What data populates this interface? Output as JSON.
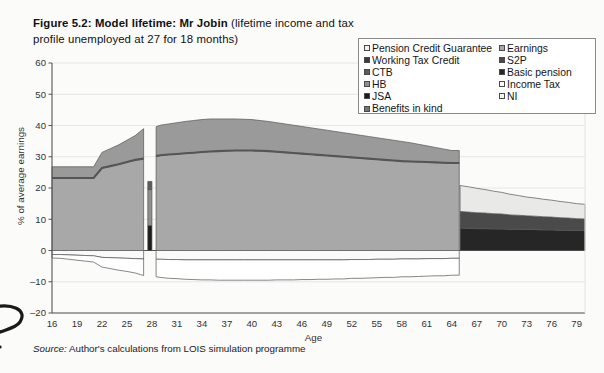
{
  "figure": {
    "title_strong": "Figure 5.2: Model lifetime: Mr Jobin",
    "title_rest": " (lifetime income and tax profile unemployed at 27 for 18 months)",
    "source_lead": "Source:",
    "source_text": " Author's calculations from LOIS simulation programme"
  },
  "legend": {
    "left_column": [
      {
        "label": "Pension Credit Guarantee",
        "swatch": "#f2f2f0"
      },
      {
        "label": "Working Tax Credit",
        "swatch": "#3b3b3b"
      },
      {
        "label": "CTB",
        "swatch": "#5d5d5d"
      },
      {
        "label": "HB",
        "swatch": "#8f8f8f"
      },
      {
        "label": "JSA",
        "swatch": "#1c1c1c"
      },
      {
        "label": "Benefits in kind",
        "swatch": "#767676"
      }
    ],
    "right_column": [
      {
        "label": "Earnings",
        "swatch": "#a8a8a8"
      },
      {
        "label": "S2P",
        "swatch": "#4a4a4a"
      },
      {
        "label": "Basic pension",
        "swatch": "#262626"
      },
      {
        "label": "Income Tax",
        "swatch": "#fbfbfa"
      },
      {
        "label": "NI",
        "swatch": "#f4f4f2"
      }
    ]
  },
  "chart_data": {
    "type": "area",
    "title": "Figure 5.2: Model lifetime: Mr Jobin (lifetime income and tax profile unemployed at 27 for 18 months)",
    "xlabel": "Age",
    "ylabel": "% of average earnings",
    "xlim": [
      16,
      80
    ],
    "ylim": [
      -20,
      60
    ],
    "ytick_values": [
      -20,
      -10,
      0,
      10,
      20,
      30,
      40,
      50,
      60
    ],
    "xtick_values": [
      16,
      19,
      22,
      25,
      28,
      31,
      34,
      37,
      40,
      43,
      46,
      49,
      52,
      55,
      58,
      61,
      64,
      67,
      70,
      73,
      76,
      79
    ],
    "grid": "horizontal",
    "legend_position": "top-right",
    "stacking": "stacked-positive-and-negative",
    "colors": {
      "earnings": "#a8a8a8",
      "benefits_in_kind": "#9a9a9a",
      "benefits_line": "#555555",
      "jsa": "#1c1c1c",
      "hb": "#8f8f8f",
      "ctb": "#5d5d5d",
      "working_tax_credit": "#3b3b3b",
      "basic_pension": "#262626",
      "s2p": "#4a4a4a",
      "pension_credit_guarantee": "#e9e9e7",
      "income_tax": "#ffffff",
      "ni": "#fafaf8",
      "outline": "#555555",
      "axis": "#555555",
      "gridline": "#e2e2e0"
    },
    "x": [
      16,
      17,
      18,
      19,
      20,
      21,
      22,
      23,
      24,
      25,
      26,
      27,
      27.5,
      28,
      28.5,
      29,
      30,
      31,
      32,
      33,
      34,
      35,
      36,
      37,
      38,
      39,
      40,
      41,
      42,
      43,
      44,
      45,
      46,
      47,
      48,
      49,
      50,
      51,
      52,
      53,
      54,
      55,
      56,
      57,
      58,
      59,
      60,
      61,
      62,
      63,
      64,
      64.9,
      65,
      66,
      67,
      68,
      69,
      70,
      71,
      72,
      73,
      74,
      75,
      76,
      77,
      78,
      79,
      80
    ],
    "series": [
      {
        "name": "Earnings",
        "key": "earnings",
        "color": "#a8a8a8",
        "values": [
          23.2,
          23.2,
          23.2,
          23.2,
          23.2,
          23.2,
          26.4,
          27.0,
          27.6,
          28.3,
          29.0,
          29.4,
          0,
          0,
          30.2,
          30.5,
          30.7,
          30.9,
          31.1,
          31.3,
          31.5,
          31.7,
          31.8,
          31.9,
          32.0,
          32.0,
          32.0,
          31.9,
          31.8,
          31.6,
          31.4,
          31.2,
          31.0,
          30.8,
          30.6,
          30.4,
          30.2,
          30.0,
          29.8,
          29.6,
          29.4,
          29.2,
          29.0,
          28.8,
          28.6,
          28.5,
          28.4,
          28.3,
          28.2,
          28.1,
          28.0,
          28.0,
          0,
          0,
          0,
          0,
          0,
          0,
          0,
          0,
          0,
          0,
          0,
          0,
          0,
          0,
          0,
          0
        ]
      },
      {
        "name": "Benefits in kind",
        "key": "benefits_in_kind",
        "color": "#9a9a9a",
        "values": [
          3.6,
          3.6,
          3.6,
          3.6,
          3.6,
          3.6,
          5.0,
          5.6,
          6.2,
          7.0,
          7.8,
          9.6,
          0,
          0,
          9.4,
          9.6,
          9.8,
          10.0,
          10.2,
          10.3,
          10.4,
          10.4,
          10.3,
          10.2,
          10.1,
          10.0,
          9.9,
          9.7,
          9.5,
          9.3,
          9.1,
          8.9,
          8.7,
          8.5,
          8.3,
          8.1,
          7.9,
          7.7,
          7.5,
          7.3,
          7.1,
          6.9,
          6.7,
          6.5,
          6.3,
          6.0,
          5.6,
          5.2,
          4.8,
          4.4,
          4.0,
          4.0,
          0,
          0,
          0,
          0,
          0,
          0,
          0,
          0,
          0,
          0,
          0,
          0,
          0,
          0,
          0,
          0
        ]
      },
      {
        "name": "JSA",
        "key": "jsa",
        "color": "#1c1c1c",
        "values": [
          0,
          0,
          0,
          0,
          0,
          0,
          0,
          0,
          0,
          0,
          0,
          0,
          8.0,
          8.0,
          0,
          0,
          0,
          0,
          0,
          0,
          0,
          0,
          0,
          0,
          0,
          0,
          0,
          0,
          0,
          0,
          0,
          0,
          0,
          0,
          0,
          0,
          0,
          0,
          0,
          0,
          0,
          0,
          0,
          0,
          0,
          0,
          0,
          0,
          0,
          0,
          0,
          0,
          0,
          0,
          0,
          0,
          0,
          0,
          0,
          0,
          0,
          0,
          0,
          0,
          0,
          0,
          0,
          0
        ]
      },
      {
        "name": "HB",
        "key": "hb",
        "color": "#8f8f8f",
        "values": [
          0,
          0,
          0,
          0,
          0,
          0,
          0,
          0,
          0,
          0,
          0,
          0,
          11.5,
          11.5,
          0,
          0,
          0,
          0,
          0,
          0,
          0,
          0,
          0,
          0,
          0,
          0,
          0,
          0,
          0,
          0,
          0,
          0,
          0,
          0,
          0,
          0,
          0,
          0,
          0,
          0,
          0,
          0,
          0,
          0,
          0,
          0,
          0,
          0,
          0,
          0,
          0,
          0,
          0,
          0,
          0,
          0,
          0,
          0,
          0,
          0,
          0,
          0,
          0,
          0,
          0,
          0,
          0,
          0
        ]
      },
      {
        "name": "CTB",
        "key": "ctb",
        "color": "#5d5d5d",
        "values": [
          0,
          0,
          0,
          0,
          0,
          0,
          0,
          0,
          0,
          0,
          0,
          0,
          2.6,
          2.6,
          0,
          0,
          0,
          0,
          0,
          0,
          0,
          0,
          0,
          0,
          0,
          0,
          0,
          0,
          0,
          0,
          0,
          0,
          0,
          0,
          0,
          0,
          0,
          0,
          0,
          0,
          0,
          0,
          0,
          0,
          0,
          0,
          0,
          0,
          0,
          0,
          0,
          0,
          0,
          0,
          0,
          0,
          0,
          0,
          0,
          0,
          0,
          0,
          0,
          0,
          0,
          0,
          0,
          0
        ]
      },
      {
        "name": "Basic pension",
        "key": "basic_pension",
        "color": "#262626",
        "values": [
          0,
          0,
          0,
          0,
          0,
          0,
          0,
          0,
          0,
          0,
          0,
          0,
          0,
          0,
          0,
          0,
          0,
          0,
          0,
          0,
          0,
          0,
          0,
          0,
          0,
          0,
          0,
          0,
          0,
          0,
          0,
          0,
          0,
          0,
          0,
          0,
          0,
          0,
          0,
          0,
          0,
          0,
          0,
          0,
          0,
          0,
          0,
          0,
          0,
          0,
          0,
          0,
          7.2,
          7.1,
          7.0,
          7.0,
          6.9,
          6.9,
          6.8,
          6.8,
          6.7,
          6.7,
          6.6,
          6.6,
          6.5,
          6.5,
          6.4,
          6.4
        ]
      },
      {
        "name": "S2P",
        "key": "s2p",
        "color": "#4a4a4a",
        "values": [
          0,
          0,
          0,
          0,
          0,
          0,
          0,
          0,
          0,
          0,
          0,
          0,
          0,
          0,
          0,
          0,
          0,
          0,
          0,
          0,
          0,
          0,
          0,
          0,
          0,
          0,
          0,
          0,
          0,
          0,
          0,
          0,
          0,
          0,
          0,
          0,
          0,
          0,
          0,
          0,
          0,
          0,
          0,
          0,
          0,
          0,
          0,
          0,
          0,
          0,
          0,
          0,
          5.3,
          5.2,
          5.1,
          5.0,
          4.9,
          4.8,
          4.6,
          4.5,
          4.4,
          4.3,
          4.2,
          4.1,
          4.0,
          3.9,
          3.8,
          3.7
        ]
      },
      {
        "name": "Pension Credit Guarantee",
        "key": "pension_credit_guarantee",
        "color": "#e9e9e7",
        "values": [
          0,
          0,
          0,
          0,
          0,
          0,
          0,
          0,
          0,
          0,
          0,
          0,
          0,
          0,
          0,
          0,
          0,
          0,
          0,
          0,
          0,
          0,
          0,
          0,
          0,
          0,
          0,
          0,
          0,
          0,
          0,
          0,
          0,
          0,
          0,
          0,
          0,
          0,
          0,
          0,
          0,
          0,
          0,
          0,
          0,
          0,
          0,
          0,
          0,
          0,
          0,
          0,
          8.3,
          8.1,
          7.8,
          7.5,
          7.2,
          6.9,
          6.6,
          6.3,
          6.0,
          5.8,
          5.6,
          5.4,
          5.2,
          5.0,
          4.8,
          4.7
        ]
      }
    ],
    "negative_series": [
      {
        "name": "NI",
        "key": "ni",
        "color": "#fafaf8",
        "values": [
          -1.3,
          -1.3,
          -1.4,
          -1.5,
          -1.6,
          -1.7,
          -2.2,
          -2.3,
          -2.4,
          -2.5,
          -2.6,
          -2.7,
          0,
          0,
          -2.8,
          -2.8,
          -2.9,
          -2.9,
          -3.0,
          -3.0,
          -3.0,
          -3.0,
          -3.0,
          -3.0,
          -3.0,
          -3.0,
          -3.0,
          -3.0,
          -3.0,
          -3.0,
          -3.0,
          -3.0,
          -3.0,
          -3.0,
          -3.0,
          -3.0,
          -3.0,
          -3.0,
          -2.9,
          -2.9,
          -2.9,
          -2.8,
          -2.8,
          -2.8,
          -2.7,
          -2.7,
          -2.7,
          -2.6,
          -2.6,
          -2.6,
          -2.5,
          -2.5,
          0,
          0,
          0,
          0,
          0,
          0,
          0,
          0,
          0,
          0,
          0,
          0,
          0,
          0,
          0,
          0
        ]
      },
      {
        "name": "Income Tax",
        "key": "income_tax",
        "color": "#ffffff",
        "values": [
          -1.1,
          -1.2,
          -1.4,
          -1.6,
          -1.8,
          -2.0,
          -3.1,
          -3.5,
          -3.9,
          -4.2,
          -4.6,
          -5.3,
          0,
          0,
          -5.6,
          -5.8,
          -6.0,
          -6.1,
          -6.2,
          -6.3,
          -6.4,
          -6.4,
          -6.5,
          -6.5,
          -6.5,
          -6.5,
          -6.5,
          -6.5,
          -6.5,
          -6.4,
          -6.4,
          -6.4,
          -6.3,
          -6.3,
          -6.2,
          -6.2,
          -6.1,
          -6.1,
          -6.0,
          -6.0,
          -5.9,
          -5.9,
          -5.8,
          -5.8,
          -5.7,
          -5.7,
          -5.6,
          -5.6,
          -5.5,
          -5.5,
          -5.4,
          -5.4,
          0,
          0,
          0,
          0,
          0,
          0,
          0,
          0,
          0,
          0,
          0,
          0,
          0,
          0,
          0,
          0
        ]
      }
    ],
    "annotations": [
      {
        "text": "unemployment gap",
        "x_range": [
          27,
          28.5
        ]
      },
      {
        "text": "retirement",
        "x_range": [
          65,
          80
        ]
      }
    ]
  }
}
